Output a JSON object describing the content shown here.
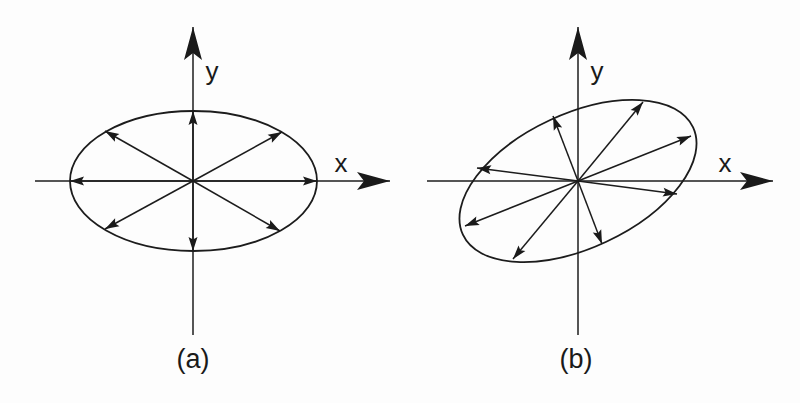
{
  "figure": {
    "width": 800,
    "height": 403,
    "colors": {
      "ink": "#1a1a1a",
      "paper": "#fdfdfd"
    },
    "panels": [
      {
        "id": "a",
        "label": "(a)",
        "label_pos": [
          193,
          368
        ],
        "origin": [
          193,
          181
        ],
        "x_axis": {
          "label": "x",
          "from": [
            35,
            181
          ],
          "to": [
            390,
            181
          ],
          "label_pos": [
            341,
            172
          ]
        },
        "y_axis": {
          "label": "y",
          "from": [
            193,
            335
          ],
          "to": [
            193,
            27
          ],
          "label_pos": [
            212,
            80
          ]
        },
        "ellipse": {
          "cx": 193.5,
          "cy": 181,
          "rx": 123.5,
          "ry": 70,
          "rotation_deg": 0
        },
        "vectors": [
          [
            317,
            181
          ],
          [
            282,
            132
          ],
          [
            193,
            111
          ],
          [
            105,
            131
          ],
          [
            70,
            181
          ],
          [
            105,
            229
          ],
          [
            193,
            251
          ],
          [
            280,
            231
          ]
        ],
        "description": "Unit circle of polarizations mapped to an axis-aligned ellipse; vectors along x and y keep their direction"
      },
      {
        "id": "b",
        "label": "(b)",
        "label_pos": [
          576,
          368
        ],
        "origin": [
          578,
          181
        ],
        "x_axis": {
          "label": "x",
          "from": [
            427,
            181
          ],
          "to": [
            773,
            181
          ],
          "label_pos": [
            725,
            172
          ]
        },
        "y_axis": {
          "label": "y",
          "from": [
            578,
            335
          ],
          "to": [
            578,
            27
          ],
          "label_pos": [
            597,
            80
          ]
        },
        "ellipse": {
          "cx": 578,
          "cy": 181,
          "rx": 127,
          "ry": 67,
          "rotation_deg": -25
        },
        "vectors": [
          [
            643,
            102
          ],
          [
            691,
            136
          ],
          [
            677,
            194
          ],
          [
            602,
            244
          ],
          [
            513,
            259
          ],
          [
            465,
            226
          ],
          [
            477,
            168
          ],
          [
            553,
            116
          ]
        ],
        "description": "Rotated (tilted) ellipse; radial vectors change direction as well as length"
      }
    ]
  }
}
